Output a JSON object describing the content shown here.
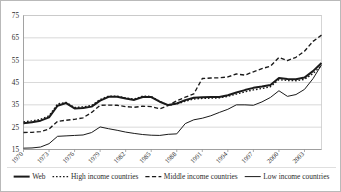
{
  "chart_data": {
    "type": "line",
    "title": "",
    "subtitle": "",
    "xlabel": "",
    "ylabel": "",
    "grid": true,
    "legend_position": "bottom",
    "xlim": [
      1970,
      2005
    ],
    "ylim": [
      15,
      75
    ],
    "yticks": [
      15,
      25,
      35,
      45,
      55,
      65,
      75
    ],
    "xticks": [
      1970,
      1973,
      1976,
      1979,
      1982,
      1985,
      1988,
      1991,
      1994,
      1997,
      2000,
      2003
    ],
    "xtick_labels": [
      "1970",
      "1973",
      "1976",
      "1979",
      "1982",
      "1985",
      "1988",
      "1991",
      "1994",
      "1997",
      "2000",
      "2003"
    ],
    "ytick_labels": [
      "15",
      "25",
      "35",
      "45",
      "55",
      "65",
      "75"
    ],
    "x": [
      1970,
      1971,
      1972,
      1973,
      1974,
      1975,
      1976,
      1977,
      1978,
      1979,
      1980,
      1981,
      1982,
      1983,
      1984,
      1985,
      1986,
      1987,
      1988,
      1989,
      1990,
      1991,
      1992,
      1993,
      1994,
      1995,
      1996,
      1997,
      1998,
      1999,
      2000,
      2001,
      2002,
      2003,
      2004,
      2005
    ],
    "series": [
      {
        "name": "Web",
        "style": "solid-thick",
        "values": [
          26.8,
          27.2,
          27.9,
          29.4,
          34.6,
          35.8,
          33.4,
          33.6,
          34.2,
          36.9,
          38.6,
          38.6,
          37.8,
          37.2,
          38.5,
          38.5,
          36.4,
          34.9,
          35.6,
          37.1,
          38.2,
          38.4,
          38.5,
          38.5,
          39.3,
          40.5,
          41.6,
          42.6,
          43.2,
          43.9,
          47.0,
          46.6,
          46.5,
          47.2,
          50.1,
          53.7
        ]
      },
      {
        "name": "High income countries",
        "style": "dotted",
        "values": [
          27.4,
          27.8,
          28.5,
          30.1,
          35.4,
          36.1,
          33.8,
          34.1,
          34.7,
          37.4,
          38.9,
          38.9,
          38.1,
          37.6,
          38.9,
          38.8,
          36.5,
          34.8,
          35.4,
          36.6,
          37.6,
          37.9,
          38.0,
          38.1,
          38.8,
          39.8,
          40.8,
          41.7,
          42.3,
          43.1,
          46.3,
          45.9,
          45.8,
          46.4,
          49.0,
          52.6
        ]
      },
      {
        "name": "Middle income countries",
        "style": "dashed",
        "values": [
          22.6,
          22.7,
          23.0,
          24.2,
          27.6,
          28.1,
          28.5,
          29.2,
          31.6,
          34.8,
          34.9,
          34.8,
          34.2,
          33.9,
          34.4,
          34.2,
          33.2,
          34.7,
          36.8,
          38.4,
          39.9,
          46.8,
          47.0,
          47.1,
          47.5,
          48.8,
          48.3,
          49.8,
          51.2,
          52.3,
          56.2,
          54.8,
          56.3,
          59.0,
          63.4,
          66.2
        ]
      },
      {
        "name": "Low income countries",
        "style": "solid-thin",
        "values": [
          15.6,
          15.7,
          16.1,
          17.6,
          20.9,
          21.1,
          21.3,
          21.5,
          22.6,
          25.1,
          24.3,
          23.6,
          22.8,
          22.2,
          21.7,
          21.4,
          21.3,
          21.8,
          22.0,
          26.6,
          28.3,
          29.0,
          30.1,
          31.6,
          33.0,
          35.0,
          35.0,
          34.8,
          36.3,
          38.3,
          41.3,
          38.8,
          39.6,
          41.9,
          46.7,
          52.9
        ]
      }
    ],
    "legend": [
      {
        "label": "Web",
        "style": "solid-thick"
      },
      {
        "label": "High income countries",
        "style": "dotted"
      },
      {
        "label": "Middle income countries",
        "style": "dashed"
      },
      {
        "label": "Low income countries",
        "style": "solid-thin"
      }
    ],
    "colors": {
      "line": "#1a1a1a",
      "grid": "#b2b2b2",
      "axis": "#8d8d8d",
      "background": "#ffffff",
      "text": "#2b2b2b"
    }
  }
}
